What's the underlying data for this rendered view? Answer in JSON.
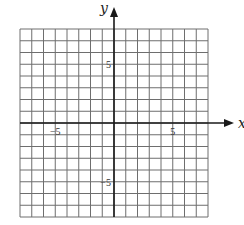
{
  "chart_data": {
    "type": "table",
    "title": "",
    "xlabel": "x",
    "ylabel": "y",
    "xlim": [
      -8,
      8
    ],
    "ylim": [
      -8,
      8
    ],
    "grid": true,
    "grid_step": 1,
    "x_tick_labels": [
      {
        "value": -5,
        "label": "−5"
      },
      {
        "value": 5,
        "label": "5"
      }
    ],
    "y_tick_labels": [
      {
        "value": 5,
        "label": "5"
      },
      {
        "value": -5,
        "label": "−5"
      }
    ],
    "series": [],
    "legend": null
  },
  "layout": {
    "origin_px": [
      114,
      123
    ],
    "cell_px": 11.75,
    "grid_color": "#6e6e6e",
    "axis_color": "#1a1a1a"
  }
}
